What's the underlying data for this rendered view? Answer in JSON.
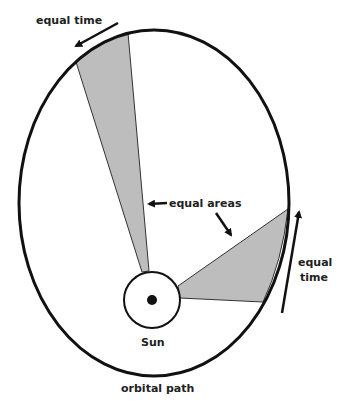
{
  "diagram": {
    "labels": {
      "equal_time_top": "equal time",
      "equal_areas": "equal areas",
      "equal_time_right_line1": "equal",
      "equal_time_right_line2": "time",
      "sun": "Sun",
      "orbital_path": "orbital path"
    },
    "colors": {
      "line": "#111111",
      "wedge_fill": "#bdbdbd",
      "background": "#ffffff"
    }
  }
}
